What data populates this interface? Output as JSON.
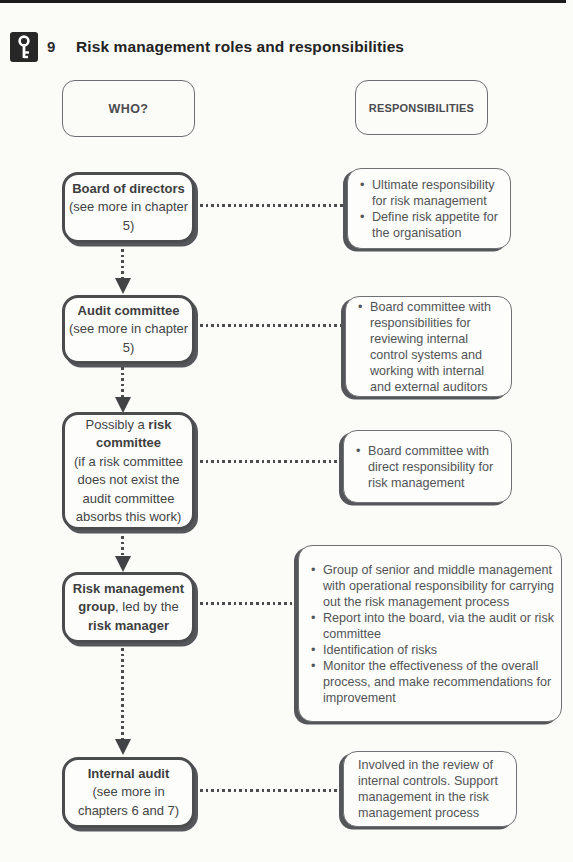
{
  "header": {
    "icon": "key-icon",
    "number": "9",
    "title": "Risk management roles and responsibilities"
  },
  "column_headers": {
    "who": "WHO?",
    "responsibilities": "RESPONSIBILITIES"
  },
  "rows": [
    {
      "who": {
        "title": "Board of directors",
        "subtitle": "(see more in chapter 5)"
      },
      "responsibilities": {
        "bullets": [
          "Ultimate responsibility for risk management",
          "Define risk appetite for the organisation"
        ]
      }
    },
    {
      "who": {
        "title": "Audit committee",
        "subtitle": "(see more in chapter 5)"
      },
      "responsibilities": {
        "bullets": [
          "Board committee with responsibilities for reviewing internal control systems and working with internal and external auditors"
        ]
      }
    },
    {
      "who": {
        "prefix": "Possibly a ",
        "title": "risk committee",
        "subtitle": "(if a risk committee does not exist the audit committee absorbs this work)"
      },
      "responsibilities": {
        "bullets": [
          "Board committee with direct responsibility for risk management"
        ]
      }
    },
    {
      "who": {
        "title": "Risk management group",
        "mid": ", led by the ",
        "title2": "risk manager"
      },
      "responsibilities": {
        "bullets": [
          "Group of senior and middle management with operational responsibility for carrying out the risk management process",
          "Report into the board, via the audit or risk committee",
          "Identification of risks",
          "Monitor the effectiveness of the overall process, and make recommendations for improvement"
        ]
      }
    },
    {
      "who": {
        "title": "Internal audit",
        "subtitle": "(see more in chapters 6 and 7)"
      },
      "responsibilities": {
        "text": "Involved in the review of internal controls. Support management in the risk management process"
      }
    }
  ],
  "colors": {
    "box_border_dark": "#4b4c4e",
    "box_border_light": "#707174",
    "text_dark": "#3d3e40",
    "text_body": "#525356",
    "top_rule": "#1c1c1c",
    "paper": "#fbfbf8"
  }
}
